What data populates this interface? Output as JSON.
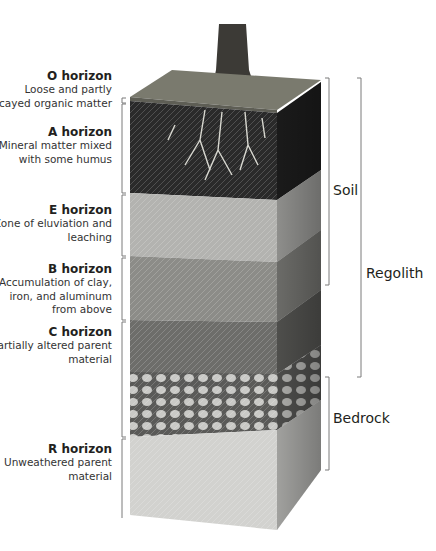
{
  "horizons": [
    {
      "id": "O",
      "title": "O horizon",
      "description": "Loose and partly decayed organic matter"
    },
    {
      "id": "A",
      "title": "A horizon",
      "description": "Mineral matter mixed with some humus"
    },
    {
      "id": "E",
      "title": "E horizon",
      "description": "Zone of eluviation and leaching"
    },
    {
      "id": "B",
      "title": "B horizon",
      "description": "Accumulation of clay, iron, and aluminum from above"
    },
    {
      "id": "C",
      "title": "C horizon",
      "description": "Partially altered parent material"
    },
    {
      "id": "R",
      "title": "R horizon",
      "description": "Unweathered parent material"
    }
  ],
  "zones": {
    "soil": "Soil",
    "regolith": "Regolith",
    "bedrock": "Bedrock"
  },
  "colors": {
    "o_layer": "#6b6b5e",
    "a_layer": "#2a2a2a",
    "e_layer": "#b3b3b0",
    "b_layer": "#8c8c88",
    "c_layer": "#6d6d6a",
    "r_layer": "#d2d2cf",
    "bracket": "#7a7a7a",
    "text": "#231f20"
  }
}
